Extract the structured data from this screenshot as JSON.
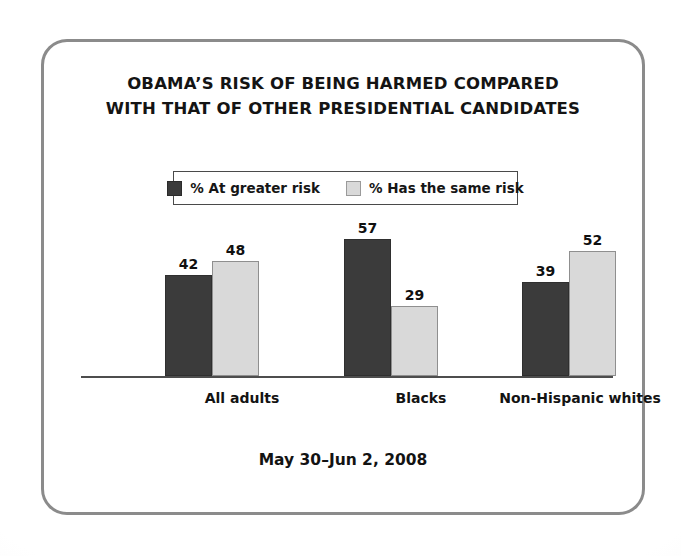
{
  "chart_data": {
    "type": "bar",
    "title_line1": "OBAMA’S RISK OF BEING HARMED COMPARED",
    "title_line2": "WITH THAT OF OTHER PRESIDENTIAL CANDIDATES",
    "xlabel": "",
    "ylabel": "",
    "ylim": [
      0,
      60
    ],
    "grid": false,
    "legend_position": "top-center",
    "categories": [
      "All adults",
      "Blacks",
      "Non-Hispanic whites"
    ],
    "series": [
      {
        "name": "% At greater risk",
        "color": "#3b3b3b",
        "values": [
          42,
          57,
          39
        ]
      },
      {
        "name": "% Has the same risk",
        "color": "#d9d9d9",
        "values": [
          48,
          29,
          52
        ]
      }
    ],
    "annotation": "May 30–Jun 2, 2008",
    "value_labels": [
      "42",
      "48",
      "57",
      "29",
      "39",
      "52"
    ]
  },
  "legend": {
    "entries": [
      {
        "label": "% At greater risk"
      },
      {
        "label": "% Has the same risk"
      }
    ]
  },
  "footer": {
    "date_range": "May 30–Jun 2, 2008"
  },
  "colors": {
    "series_dark": "#3b3b3b",
    "series_light": "#d9d9d9",
    "frame": "#8b8b8b",
    "axis": "#4d4d4d",
    "text": "#131313"
  }
}
